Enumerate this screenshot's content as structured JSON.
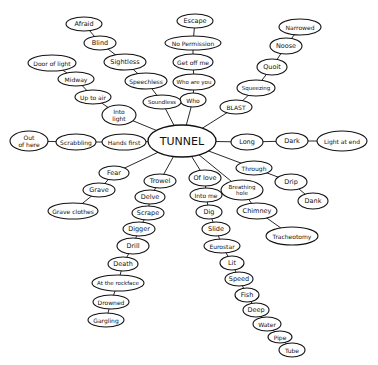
{
  "title": "TUNNEL",
  "colors": {
    "ink": "#111111",
    "paper": "#ffffff"
  },
  "center": {
    "id": "tunnel",
    "label": "TUNNEL",
    "x": 182,
    "y": 141,
    "rx": 34,
    "ry": 16,
    "fs": 11
  },
  "nodes": [
    {
      "id": "escape",
      "label": "Escape",
      "x": 195,
      "y": 21,
      "rx": 18,
      "ry": 7,
      "fs": 6.5
    },
    {
      "id": "nopermission",
      "label": "No Permission",
      "x": 193,
      "y": 43,
      "rx": 28,
      "ry": 7,
      "fs": 6
    },
    {
      "id": "getoffme",
      "label": "Get off me",
      "x": 193,
      "y": 62,
      "rx": 20,
      "ry": 8,
      "fs": 6
    },
    {
      "id": "whoareyou",
      "label": "Who are you",
      "x": 194,
      "y": 82,
      "rx": 21,
      "ry": 8,
      "fs": 5.5
    },
    {
      "id": "who",
      "label": "Who",
      "x": 193,
      "y": 100,
      "rx": 13,
      "ry": 7,
      "fs": 6
    },
    {
      "id": "afraid",
      "label": "Afraid",
      "x": 84,
      "y": 24,
      "rx": 18,
      "ry": 7,
      "fs": 6.5
    },
    {
      "id": "blind",
      "label": "Blind",
      "x": 100,
      "y": 43,
      "rx": 16,
      "ry": 7,
      "fs": 6.5
    },
    {
      "id": "sightless",
      "label": "Sightless",
      "x": 125,
      "y": 62,
      "rx": 21,
      "ry": 8,
      "fs": 6.5
    },
    {
      "id": "speechless",
      "label": "Speechless",
      "x": 146,
      "y": 81,
      "rx": 21,
      "ry": 8,
      "fs": 6
    },
    {
      "id": "soundless",
      "label": "Soundless",
      "x": 162,
      "y": 102,
      "rx": 19,
      "ry": 7,
      "fs": 5.5
    },
    {
      "id": "dooroflight",
      "label": "Door of light",
      "x": 52,
      "y": 63,
      "rx": 24,
      "ry": 8,
      "fs": 6
    },
    {
      "id": "midway",
      "label": "Midway",
      "x": 76,
      "y": 79,
      "rx": 18,
      "ry": 7,
      "fs": 6
    },
    {
      "id": "uptoair",
      "label": "Up to air",
      "x": 93,
      "y": 97,
      "rx": 18,
      "ry": 7,
      "fs": 6
    },
    {
      "id": "intolight",
      "label": "Into light",
      "lines": [
        "Into",
        "light"
      ],
      "x": 119,
      "y": 115,
      "rx": 17,
      "ry": 10,
      "fs": 6
    },
    {
      "id": "hands",
      "label": "Hands first",
      "x": 124,
      "y": 142,
      "rx": 22,
      "ry": 8,
      "fs": 6
    },
    {
      "id": "scrabbling",
      "label": "Scrabbling",
      "x": 76,
      "y": 142,
      "rx": 20,
      "ry": 8,
      "fs": 6
    },
    {
      "id": "outofhere",
      "label": "Out of here",
      "lines": [
        "Out",
        "of here"
      ],
      "x": 29,
      "y": 141,
      "rx": 19,
      "ry": 10,
      "fs": 6
    },
    {
      "id": "fear",
      "label": "Fear",
      "x": 114,
      "y": 173,
      "rx": 15,
      "ry": 7,
      "fs": 6.5
    },
    {
      "id": "grave",
      "label": "Grave",
      "x": 99,
      "y": 190,
      "rx": 16,
      "ry": 7,
      "fs": 6.5
    },
    {
      "id": "graveclothes",
      "label": "Grave clothes",
      "x": 73,
      "y": 211,
      "rx": 25,
      "ry": 8,
      "fs": 6
    },
    {
      "id": "trowel",
      "label": "Trowel",
      "x": 160,
      "y": 181,
      "rx": 16,
      "ry": 7,
      "fs": 6.5
    },
    {
      "id": "delve",
      "label": "Delve",
      "x": 150,
      "y": 197,
      "rx": 15,
      "ry": 7,
      "fs": 6.5
    },
    {
      "id": "scrape",
      "label": "Scrape",
      "x": 148,
      "y": 213,
      "rx": 16,
      "ry": 7,
      "fs": 6.5
    },
    {
      "id": "digger",
      "label": "Digger",
      "x": 139,
      "y": 229,
      "rx": 16,
      "ry": 7,
      "fs": 6.5
    },
    {
      "id": "drill",
      "label": "Drill",
      "x": 133,
      "y": 246,
      "rx": 16,
      "ry": 8,
      "fs": 6.5
    },
    {
      "id": "death",
      "label": "Death",
      "x": 123,
      "y": 264,
      "rx": 15,
      "ry": 7,
      "fs": 6.5
    },
    {
      "id": "atrockface",
      "label": "At the rockface",
      "x": 118,
      "y": 283,
      "rx": 26,
      "ry": 8,
      "fs": 5.5
    },
    {
      "id": "drowned",
      "label": "Drowned",
      "x": 111,
      "y": 302,
      "rx": 18,
      "ry": 7,
      "fs": 6
    },
    {
      "id": "gargling",
      "label": "Gargling",
      "x": 106,
      "y": 320,
      "rx": 18,
      "ry": 7,
      "fs": 6
    },
    {
      "id": "oflove",
      "label": "Of love",
      "x": 205,
      "y": 178,
      "rx": 16,
      "ry": 8,
      "fs": 6.5
    },
    {
      "id": "intome",
      "label": "Into me",
      "x": 206,
      "y": 195,
      "rx": 16,
      "ry": 7,
      "fs": 6
    },
    {
      "id": "dig",
      "label": "Dig",
      "x": 209,
      "y": 212,
      "rx": 13,
      "ry": 7,
      "fs": 6.5
    },
    {
      "id": "slide",
      "label": "Slide",
      "x": 216,
      "y": 229,
      "rx": 14,
      "ry": 7,
      "fs": 6.5
    },
    {
      "id": "eurostar",
      "label": "Eurostar",
      "x": 222,
      "y": 246,
      "rx": 18,
      "ry": 7,
      "fs": 6
    },
    {
      "id": "lit",
      "label": "Lit",
      "x": 232,
      "y": 263,
      "rx": 12,
      "ry": 7,
      "fs": 6.5
    },
    {
      "id": "speed",
      "label": "Speed",
      "x": 239,
      "y": 279,
      "rx": 14,
      "ry": 7,
      "fs": 6.5
    },
    {
      "id": "fish",
      "label": "Fish",
      "x": 247,
      "y": 295,
      "rx": 12,
      "ry": 7,
      "fs": 6.5
    },
    {
      "id": "deep",
      "label": "Deep",
      "x": 256,
      "y": 310,
      "rx": 13,
      "ry": 7,
      "fs": 6.5
    },
    {
      "id": "water",
      "label": "Water",
      "x": 267,
      "y": 324,
      "rx": 14,
      "ry": 7,
      "fs": 6
    },
    {
      "id": "pipe",
      "label": "Pipe",
      "x": 280,
      "y": 337,
      "rx": 12,
      "ry": 6,
      "fs": 6
    },
    {
      "id": "tube",
      "label": "Tube",
      "x": 292,
      "y": 350,
      "rx": 13,
      "ry": 7,
      "fs": 6
    },
    {
      "id": "breathinghole",
      "label": "Breathing hole",
      "lines": [
        "Breathing",
        "hole"
      ],
      "x": 242,
      "y": 190,
      "rx": 21,
      "ry": 10,
      "fs": 5.5
    },
    {
      "id": "chimney",
      "label": "Chimney",
      "x": 257,
      "y": 211,
      "rx": 20,
      "ry": 8,
      "fs": 6.5
    },
    {
      "id": "tracheotomy",
      "label": "Tracheotomy",
      "x": 292,
      "y": 236,
      "rx": 26,
      "ry": 9,
      "fs": 6
    },
    {
      "id": "through",
      "label": "Through",
      "x": 254,
      "y": 168,
      "rx": 18,
      "ry": 7,
      "fs": 6
    },
    {
      "id": "drip",
      "label": "Drip",
      "x": 291,
      "y": 182,
      "rx": 16,
      "ry": 8,
      "fs": 6.5
    },
    {
      "id": "dank",
      "label": "Dank",
      "x": 313,
      "y": 201,
      "rx": 15,
      "ry": 8,
      "fs": 6.5
    },
    {
      "id": "long",
      "label": "Long",
      "x": 247,
      "y": 142,
      "rx": 16,
      "ry": 8,
      "fs": 6.5
    },
    {
      "id": "dark",
      "label": "Dark",
      "x": 292,
      "y": 141,
      "rx": 16,
      "ry": 8,
      "fs": 6.5
    },
    {
      "id": "lightatend",
      "label": "Light at end",
      "x": 342,
      "y": 141,
      "rx": 25,
      "ry": 10,
      "fs": 6
    },
    {
      "id": "blast",
      "label": "BLAST",
      "x": 236,
      "y": 107,
      "rx": 16,
      "ry": 7,
      "fs": 6
    },
    {
      "id": "squeezing",
      "label": "Squeezing",
      "x": 256,
      "y": 88,
      "rx": 19,
      "ry": 8,
      "fs": 5.5
    },
    {
      "id": "quoit",
      "label": "Quoit",
      "x": 272,
      "y": 67,
      "rx": 15,
      "ry": 8,
      "fs": 6.5
    },
    {
      "id": "noose",
      "label": "Noose",
      "x": 286,
      "y": 46,
      "rx": 16,
      "ry": 8,
      "fs": 6.5
    },
    {
      "id": "narrowed",
      "label": "Narrowed",
      "x": 300,
      "y": 27,
      "rx": 21,
      "ry": 8,
      "fs": 6
    }
  ],
  "edges": [
    [
      "tunnel",
      "who"
    ],
    [
      "who",
      "whoareyou"
    ],
    [
      "whoareyou",
      "getoffme"
    ],
    [
      "getoffme",
      "nopermission"
    ],
    [
      "nopermission",
      "escape"
    ],
    [
      "tunnel",
      "soundless"
    ],
    [
      "soundless",
      "speechless"
    ],
    [
      "speechless",
      "sightless"
    ],
    [
      "sightless",
      "blind"
    ],
    [
      "blind",
      "afraid"
    ],
    [
      "tunnel",
      "intolight"
    ],
    [
      "intolight",
      "uptoair"
    ],
    [
      "uptoair",
      "midway"
    ],
    [
      "midway",
      "dooroflight"
    ],
    [
      "tunnel",
      "hands"
    ],
    [
      "hands",
      "scrabbling"
    ],
    [
      "scrabbling",
      "outofhere"
    ],
    [
      "tunnel",
      "fear"
    ],
    [
      "fear",
      "grave"
    ],
    [
      "grave",
      "graveclothes"
    ],
    [
      "tunnel",
      "trowel"
    ],
    [
      "trowel",
      "delve"
    ],
    [
      "delve",
      "scrape"
    ],
    [
      "scrape",
      "digger"
    ],
    [
      "digger",
      "drill"
    ],
    [
      "drill",
      "death"
    ],
    [
      "death",
      "atrockface"
    ],
    [
      "atrockface",
      "drowned"
    ],
    [
      "drowned",
      "gargling"
    ],
    [
      "tunnel",
      "oflove"
    ],
    [
      "oflove",
      "intome"
    ],
    [
      "intome",
      "dig"
    ],
    [
      "dig",
      "slide"
    ],
    [
      "slide",
      "eurostar"
    ],
    [
      "eurostar",
      "lit"
    ],
    [
      "lit",
      "speed"
    ],
    [
      "speed",
      "fish"
    ],
    [
      "fish",
      "deep"
    ],
    [
      "deep",
      "water"
    ],
    [
      "water",
      "pipe"
    ],
    [
      "pipe",
      "tube"
    ],
    [
      "tunnel",
      "breathinghole"
    ],
    [
      "breathinghole",
      "chimney"
    ],
    [
      "chimney",
      "tracheotomy"
    ],
    [
      "tunnel",
      "through"
    ],
    [
      "through",
      "drip"
    ],
    [
      "drip",
      "dank"
    ],
    [
      "tunnel",
      "long"
    ],
    [
      "long",
      "dark"
    ],
    [
      "dark",
      "lightatend"
    ],
    [
      "tunnel",
      "blast"
    ],
    [
      "blast",
      "squeezing"
    ],
    [
      "squeezing",
      "quoit"
    ],
    [
      "quoit",
      "noose"
    ],
    [
      "noose",
      "narrowed"
    ]
  ]
}
